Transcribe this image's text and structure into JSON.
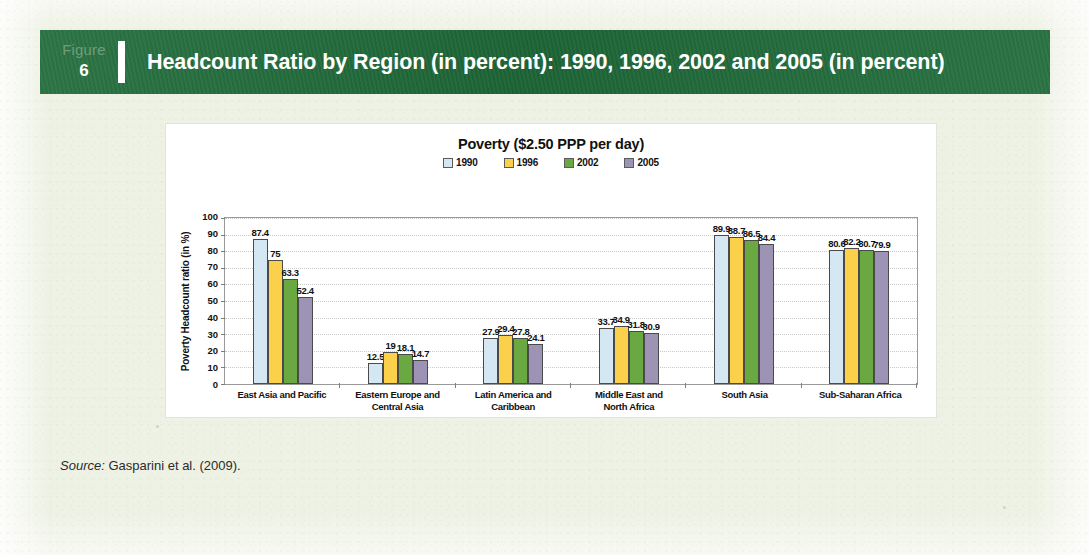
{
  "header": {
    "figure_word": "Figure",
    "figure_number": "6",
    "title": "Headcount Ratio by Region (in percent): 1990, 1996, 2002 and 2005 (in percent)",
    "band_color": "#1f6b39"
  },
  "source": {
    "label": "Source:",
    "text": " Gasparini et al. (2009)."
  },
  "chart_data": {
    "type": "bar",
    "title": "Poverty ($2.50 PPP per day)",
    "xlabel": "",
    "ylabel": "Poverty Headcount ratio (in %)",
    "ylim": [
      0,
      100
    ],
    "yticks": [
      "100",
      "90",
      "80",
      "70",
      "60",
      "50",
      "40",
      "30",
      "20",
      "10",
      "0"
    ],
    "grid": true,
    "legend_position": "top-center",
    "categories": [
      "East Asia and Pacific",
      "Eastern Europe and Central Asia",
      "Latin America and Caribbean",
      "Middle East and North Africa",
      "South Asia",
      "Sub-Saharan Africa"
    ],
    "category_lines": [
      [
        "East Asia and Pacific"
      ],
      [
        "Eastern Europe and",
        "Central Asia"
      ],
      [
        "Latin America and",
        "Caribbean"
      ],
      [
        "Middle East and",
        "North Africa"
      ],
      [
        "South Asia"
      ],
      [
        "Sub-Saharan Africa"
      ]
    ],
    "series": [
      {
        "name": "1990",
        "color": "#d5e7f2",
        "values": [
          87.4,
          12.5,
          27.9,
          33.7,
          89.9,
          80.6
        ]
      },
      {
        "name": "1996",
        "color": "#fbd14b",
        "values": [
          75,
          19,
          29.4,
          34.9,
          88.7,
          82.2
        ]
      },
      {
        "name": "2002",
        "color": "#6aa842",
        "values": [
          63.3,
          18.1,
          27.8,
          31.8,
          86.5,
          80.7
        ]
      },
      {
        "name": "2005",
        "color": "#9d93b4",
        "values": [
          52.4,
          14.7,
          24.1,
          30.9,
          84.4,
          79.9
        ]
      }
    ],
    "value_labels": [
      [
        "87.4",
        "75",
        "63.3",
        "52.4"
      ],
      [
        "12.5",
        "19",
        "18.1",
        "14.7"
      ],
      [
        "27.9",
        "29.4",
        "27.8",
        "24.1"
      ],
      [
        "33.7",
        "34.9",
        "31.8",
        "30.9"
      ],
      [
        "89.9",
        "88.7",
        "86.5",
        "84.4"
      ],
      [
        "80.6",
        "82.2",
        "80.7",
        "79.9"
      ]
    ]
  }
}
